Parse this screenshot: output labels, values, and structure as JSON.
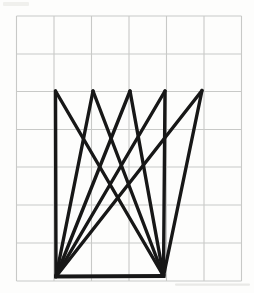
{
  "canvas": {
    "width": 254,
    "height": 293,
    "background_color": "#fdfdfc"
  },
  "grid": {
    "description": "graph-paper grid, 6 columns x 7 rows",
    "color": "#c8c9c7",
    "stroke_width": 1.1,
    "x_lines": [
      16.5,
      54,
      91.5,
      129,
      166.5,
      204,
      241.5
    ],
    "y_lines": [
      16,
      54,
      91.5,
      129.5,
      167,
      205,
      243,
      281
    ],
    "x_min": 16.5,
    "x_max": 241.5,
    "y_min": 16,
    "y_max": 281,
    "columns": 6,
    "rows": 7
  },
  "figure": {
    "stroke_color": "#171717",
    "stroke_width": 3.4,
    "base_stroke_width": 4.0,
    "points": {
      "T1": [
        55.5,
        91
      ],
      "T2": [
        93,
        91
      ],
      "T3": [
        130,
        91
      ],
      "T4": [
        165,
        91
      ],
      "T5": [
        202,
        90.5
      ],
      "BL": [
        56,
        276.5
      ],
      "BR": [
        163.5,
        276
      ]
    },
    "fan_edges": [
      [
        "T1",
        "BL"
      ],
      [
        "T2",
        "BL"
      ],
      [
        "T3",
        "BL"
      ],
      [
        "T4",
        "BL"
      ],
      [
        "T5",
        "BL"
      ],
      [
        "T1",
        "BR"
      ],
      [
        "T2",
        "BR"
      ],
      [
        "T3",
        "BR"
      ],
      [
        "T4",
        "BR"
      ],
      [
        "T5",
        "BR"
      ]
    ],
    "base_edge": [
      "BL",
      "BR"
    ]
  },
  "artifacts": [
    {
      "x": 175,
      "y": 283.5,
      "width": 75,
      "height": 2.2,
      "color": "#e4e4e1",
      "opacity": 0.8,
      "label": "faint scan streak below grid"
    },
    {
      "x": 3,
      "y": 2,
      "width": 26,
      "height": 4,
      "color": "#e9e9e7",
      "opacity": 0.7,
      "label": "faint show-through mark top-left"
    }
  ]
}
